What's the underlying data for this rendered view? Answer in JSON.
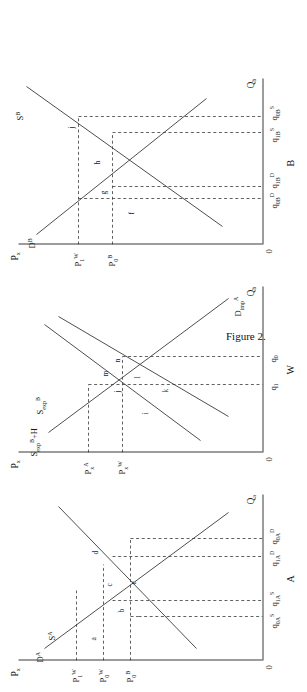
{
  "figure": {
    "caption": "Figure 2.",
    "panels": [
      {
        "id": "A",
        "name": "A",
        "price_axis_label": "P",
        "price_axis_sub": "x",
        "quantity_axis_label": "Q",
        "quantity_axis_sub": "a",
        "origin_label": "0",
        "curves": [
          {
            "name": "demand-a",
            "label_main": "D",
            "label_sup": "A"
          },
          {
            "name": "supply-a",
            "label_main": "S",
            "label_sup": "A"
          }
        ],
        "price_ticks": [
          {
            "main": "P",
            "sub": "1",
            "sup": "W"
          },
          {
            "main": "P",
            "sub": "0",
            "sup": "W"
          },
          {
            "main": "P",
            "sub": "0",
            "sup": "B"
          }
        ],
        "quantity_ticks": [
          {
            "main": "q",
            "sub": "0A",
            "sup": "S"
          },
          {
            "main": "q",
            "sub": "1A",
            "sup": "S"
          },
          {
            "main": "q",
            "sub": "1A",
            "sup": "D"
          },
          {
            "main": "q",
            "sub": "0A",
            "sup": "D"
          }
        ],
        "area_labels": [
          "a",
          "b",
          "c",
          "d",
          "e"
        ]
      },
      {
        "id": "W",
        "name": "W",
        "price_axis_label": "P",
        "price_axis_sub": "x",
        "quantity_axis_label": "Q",
        "quantity_axis_sub": "b",
        "origin_label": "0",
        "curves": [
          {
            "name": "export-supply-b-plus-h",
            "label_main": "S",
            "label_sub": "exp",
            "label_sup": "B",
            "label_tail": "+H"
          },
          {
            "name": "export-supply-b",
            "label_main": "S",
            "label_sub": "exp",
            "label_sup": "B"
          },
          {
            "name": "import-demand-a",
            "label_main": "D",
            "label_sub": "imp",
            "label_sup": "A"
          }
        ],
        "price_ticks": [
          {
            "main": "P",
            "sub": "x",
            "sup": "A"
          },
          {
            "main": "P",
            "sub": "x",
            "sup": "W"
          }
        ],
        "quantity_ticks": [
          {
            "main": "q",
            "sub": "1",
            "sup": ""
          },
          {
            "main": "q",
            "sub": "0",
            "sup": ""
          }
        ],
        "area_labels": [
          "i",
          "j",
          "k",
          "l",
          "m",
          "n"
        ]
      },
      {
        "id": "B",
        "name": "B",
        "price_axis_label": "P",
        "price_axis_sub": "x",
        "quantity_axis_label": "Q",
        "quantity_axis_sub": "b",
        "origin_label": "0",
        "curves": [
          {
            "name": "supply-b",
            "label_main": "S",
            "label_sup": "B"
          },
          {
            "name": "demand-b",
            "label_main": "D",
            "label_sup": "B"
          }
        ],
        "price_ticks": [
          {
            "main": "P",
            "sub": "1",
            "sup": "W"
          },
          {
            "main": "P",
            "sub": "0",
            "sup": "B"
          }
        ],
        "quantity_ticks": [
          {
            "main": "q",
            "sub": "0B",
            "sup": "D"
          },
          {
            "main": "q",
            "sub": "1B",
            "sup": "D"
          },
          {
            "main": "q",
            "sub": "1B",
            "sup": "S"
          },
          {
            "main": "q",
            "sub": "0B",
            "sup": "S"
          }
        ],
        "area_labels": [
          "f",
          "g",
          "h",
          "j"
        ]
      }
    ]
  },
  "colors": {
    "ink": "#3a3a3a",
    "background": "#ffffff"
  }
}
